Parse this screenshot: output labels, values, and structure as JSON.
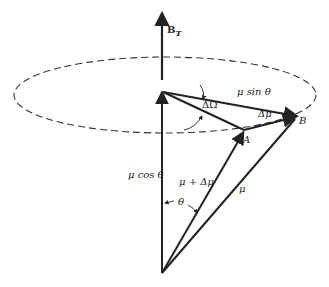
{
  "diagram": {
    "type": "vector precession diagram",
    "labels": {
      "field": "B",
      "field_sub": "T",
      "mu_sin_theta": "μ sin θ",
      "delta_omega": "ΔΩ",
      "delta_mu": "Δμ",
      "point_b": "B",
      "point_a": "A",
      "mu_cos_theta": "μ cos θ",
      "mu_plus_delta_mu": "μ + Δμ",
      "mu": "μ",
      "theta": "θ"
    },
    "colors": {
      "ink": "#222222",
      "background": "#ffffff"
    }
  }
}
